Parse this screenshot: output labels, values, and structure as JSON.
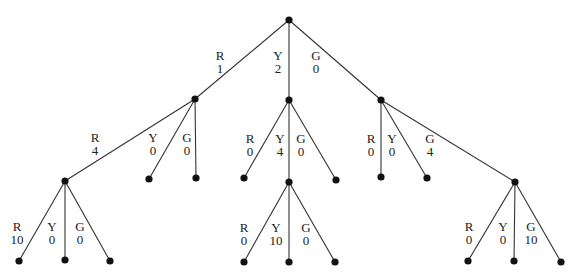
{
  "diagram": {
    "type": "tree",
    "root": "n0",
    "nodes": [
      {
        "id": "n0",
        "x": 289,
        "y": 20
      },
      {
        "id": "n1",
        "x": 195,
        "y": 99
      },
      {
        "id": "n2",
        "x": 289,
        "y": 100
      },
      {
        "id": "n3",
        "x": 381,
        "y": 100
      },
      {
        "id": "n4",
        "x": 65,
        "y": 181
      },
      {
        "id": "n5",
        "x": 149,
        "y": 179
      },
      {
        "id": "n6",
        "x": 196,
        "y": 178
      },
      {
        "id": "n7",
        "x": 244,
        "y": 178
      },
      {
        "id": "n8",
        "x": 289,
        "y": 182
      },
      {
        "id": "n9",
        "x": 336,
        "y": 180
      },
      {
        "id": "n10",
        "x": 381,
        "y": 177
      },
      {
        "id": "n11",
        "x": 427,
        "y": 178
      },
      {
        "id": "n12",
        "x": 515,
        "y": 182
      },
      {
        "id": "n13",
        "x": 19,
        "y": 261
      },
      {
        "id": "n14",
        "x": 65,
        "y": 260
      },
      {
        "id": "n15",
        "x": 110,
        "y": 261
      },
      {
        "id": "n16",
        "x": 244,
        "y": 262
      },
      {
        "id": "n17",
        "x": 289,
        "y": 262
      },
      {
        "id": "n18",
        "x": 335,
        "y": 262
      },
      {
        "id": "n19",
        "x": 468,
        "y": 261
      },
      {
        "id": "n20",
        "x": 514,
        "y": 261
      },
      {
        "id": "n21",
        "x": 561,
        "y": 262
      }
    ],
    "edges": [
      {
        "from": "n0",
        "to": "n1"
      },
      {
        "from": "n0",
        "to": "n2"
      },
      {
        "from": "n0",
        "to": "n3"
      },
      {
        "from": "n1",
        "to": "n4"
      },
      {
        "from": "n1",
        "to": "n5"
      },
      {
        "from": "n1",
        "to": "n6"
      },
      {
        "from": "n2",
        "to": "n7"
      },
      {
        "from": "n2",
        "to": "n8"
      },
      {
        "from": "n2",
        "to": "n9"
      },
      {
        "from": "n3",
        "to": "n10"
      },
      {
        "from": "n3",
        "to": "n11"
      },
      {
        "from": "n3",
        "to": "n12"
      },
      {
        "from": "n4",
        "to": "n13"
      },
      {
        "from": "n4",
        "to": "n14"
      },
      {
        "from": "n4",
        "to": "n15"
      },
      {
        "from": "n8",
        "to": "n16"
      },
      {
        "from": "n8",
        "to": "n17"
      },
      {
        "from": "n8",
        "to": "n18"
      },
      {
        "from": "n12",
        "to": "n19"
      },
      {
        "from": "n12",
        "to": "n20"
      },
      {
        "from": "n12",
        "to": "n21"
      }
    ],
    "labels": [
      {
        "letter": "R",
        "value": "1",
        "x": 220,
        "y": 60
      },
      {
        "letter": "Y",
        "value": "2",
        "x": 278,
        "y": 60
      },
      {
        "letter": "G",
        "value": "0",
        "x": 316,
        "y": 60
      },
      {
        "letter": "R",
        "value": "4",
        "x": 95,
        "y": 142
      },
      {
        "letter": "Y",
        "value": "0",
        "x": 153,
        "y": 142
      },
      {
        "letter": "G",
        "value": "0",
        "x": 187,
        "y": 142
      },
      {
        "letter": "R",
        "value": "0",
        "x": 250,
        "y": 143
      },
      {
        "letter": "Y",
        "value": "4",
        "x": 280,
        "y": 143
      },
      {
        "letter": "G",
        "value": "0",
        "x": 301,
        "y": 143
      },
      {
        "letter": "R",
        "value": "0",
        "x": 371,
        "y": 143
      },
      {
        "letter": "Y",
        "value": "0",
        "x": 392,
        "y": 143
      },
      {
        "letter": "G",
        "value": "4",
        "x": 430,
        "y": 143
      },
      {
        "letter": "R",
        "value": "10",
        "x": 17,
        "y": 231
      },
      {
        "letter": "Y",
        "value": "0",
        "x": 52,
        "y": 231
      },
      {
        "letter": "G",
        "value": "0",
        "x": 80,
        "y": 231
      },
      {
        "letter": "R",
        "value": "0",
        "x": 244,
        "y": 232
      },
      {
        "letter": "Y",
        "value": "10",
        "x": 276,
        "y": 232
      },
      {
        "letter": "G",
        "value": "0",
        "x": 306,
        "y": 232
      },
      {
        "letter": "R",
        "value": "0",
        "x": 469,
        "y": 231
      },
      {
        "letter": "Y",
        "value": "0",
        "x": 503,
        "y": 231
      },
      {
        "letter": "G",
        "value": "10",
        "x": 531,
        "y": 231
      }
    ]
  }
}
